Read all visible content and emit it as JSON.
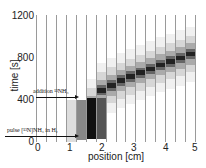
{
  "chart_data": {
    "type": "heatmap",
    "title": "",
    "xlabel": "position [cm]",
    "ylabel": "time [s]",
    "xlim": [
      0,
      5
    ],
    "ylim": [
      0,
      1200
    ],
    "xticks": [
      "0",
      "1",
      "2",
      "3",
      "4",
      "5"
    ],
    "yticks": [
      "0",
      "400",
      "800",
      "1200"
    ],
    "grid": "vertical lines separating 16 position columns",
    "annotations": [
      {
        "text": "addition ¹³NH₃",
        "time_s": 400,
        "arrow_to_position_cm": 1.25
      },
      {
        "text": "pulse [¹³N]NH₃ in H₂",
        "time_s": 30,
        "arrow_to_position_cm": 1.25
      }
    ],
    "band_centers": [
      {
        "position_cm": 1.6,
        "time_s": 250
      },
      {
        "position_cm": 1.9,
        "time_s": 470
      },
      {
        "position_cm": 2.5,
        "time_s": 560
      },
      {
        "position_cm": 3.0,
        "time_s": 620
      },
      {
        "position_cm": 3.5,
        "time_s": 680
      },
      {
        "position_cm": 4.0,
        "time_s": 740
      },
      {
        "position_cm": 4.5,
        "time_s": 790
      },
      {
        "position_cm": 5.0,
        "time_s": 850
      }
    ]
  },
  "labels": {
    "y0": "0",
    "y400": "400",
    "y800": "800",
    "y1200": "1200",
    "x0": "0",
    "x1": "1",
    "x2": "2",
    "x3": "3",
    "x4": "4",
    "x5": "5",
    "xlabel": "position [cm]",
    "ylabel": "time [s]",
    "anno_addition": "addition ¹³NH₃",
    "anno_pulse": "pulse [¹³N]NH₃ in H₂"
  }
}
